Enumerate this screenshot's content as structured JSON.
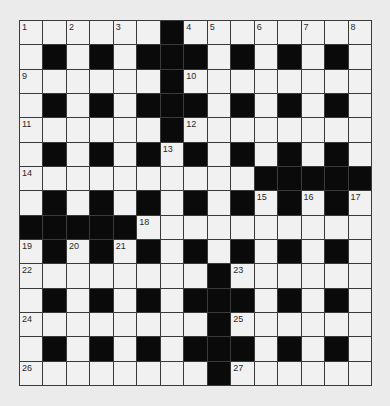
{
  "puzzle": {
    "type": "crossword",
    "rows": 15,
    "cols": 15,
    "colors": {
      "background": "#ebebeb",
      "white_cell": "#f1f1f1",
      "black_cell": "#0a0a0a",
      "grid_line": "#3a3a3a",
      "number": "#2a2a2a"
    },
    "layout": [
      "......#........",
      ".#.#.###.#.#.#.",
      "......#........",
      ".#.#.###.#.#.#.",
      "......#........",
      ".#.#.#.#.#.#.#.",
      "..........#####",
      ".#.#.#.#.#.#.#.",
      "#####..........",
      ".#.#.#.#.#.#.#.",
      "........#......",
      ".#.#.#.###.#.#.",
      "........#......",
      ".#.#.#.###.#.#.",
      "........#......"
    ],
    "numbers": [
      {
        "n": "1",
        "r": 0,
        "c": 0
      },
      {
        "n": "2",
        "r": 0,
        "c": 2
      },
      {
        "n": "3",
        "r": 0,
        "c": 4
      },
      {
        "n": "4",
        "r": 0,
        "c": 7
      },
      {
        "n": "5",
        "r": 0,
        "c": 8
      },
      {
        "n": "6",
        "r": 0,
        "c": 10
      },
      {
        "n": "7",
        "r": 0,
        "c": 12
      },
      {
        "n": "8",
        "r": 0,
        "c": 14
      },
      {
        "n": "9",
        "r": 2,
        "c": 0
      },
      {
        "n": "10",
        "r": 2,
        "c": 7
      },
      {
        "n": "11",
        "r": 4,
        "c": 0
      },
      {
        "n": "12",
        "r": 4,
        "c": 7
      },
      {
        "n": "13",
        "r": 5,
        "c": 6
      },
      {
        "n": "14",
        "r": 6,
        "c": 0
      },
      {
        "n": "15",
        "r": 7,
        "c": 10
      },
      {
        "n": "16",
        "r": 7,
        "c": 12
      },
      {
        "n": "17",
        "r": 7,
        "c": 14
      },
      {
        "n": "18",
        "r": 8,
        "c": 5
      },
      {
        "n": "19",
        "r": 9,
        "c": 0
      },
      {
        "n": "20",
        "r": 9,
        "c": 2
      },
      {
        "n": "21",
        "r": 9,
        "c": 4
      },
      {
        "n": "22",
        "r": 10,
        "c": 0
      },
      {
        "n": "23",
        "r": 10,
        "c": 9
      },
      {
        "n": "24",
        "r": 12,
        "c": 0
      },
      {
        "n": "25",
        "r": 12,
        "c": 9
      },
      {
        "n": "26",
        "r": 14,
        "c": 0
      },
      {
        "n": "27",
        "r": 14,
        "c": 9
      }
    ],
    "entries": []
  }
}
